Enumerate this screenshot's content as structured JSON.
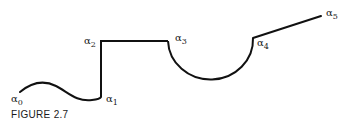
{
  "figure": {
    "caption": "FIGURE 2.7",
    "stroke_color": "#111111",
    "labels": [
      {
        "id": "a0",
        "symbol": "α",
        "sub": "0"
      },
      {
        "id": "a1",
        "symbol": "α",
        "sub": "1"
      },
      {
        "id": "a2",
        "symbol": "α",
        "sub": "2"
      },
      {
        "id": "a3",
        "symbol": "α",
        "sub": "3"
      },
      {
        "id": "a4",
        "symbol": "α",
        "sub": "4"
      },
      {
        "id": "a5",
        "symbol": "α",
        "sub": "5"
      }
    ],
    "segments": [
      {
        "from": "α0",
        "to": "α1",
        "shape": "wave"
      },
      {
        "from": "α1",
        "to": "α2",
        "shape": "vertical-line"
      },
      {
        "from": "α2",
        "to": "α3",
        "shape": "horizontal-line"
      },
      {
        "from": "α3",
        "to": "α4",
        "shape": "semicircle"
      },
      {
        "from": "α4",
        "to": "α5",
        "shape": "line"
      }
    ]
  }
}
